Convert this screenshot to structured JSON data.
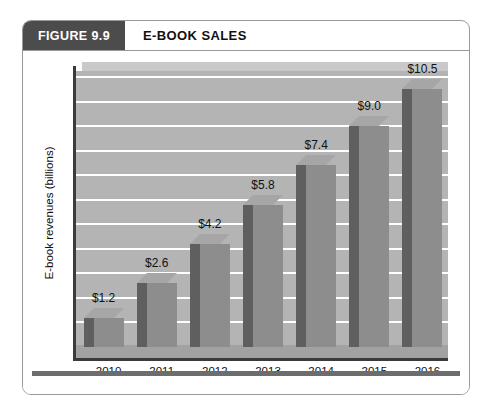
{
  "figure": {
    "number_label": "FIGURE 9.9",
    "title": "E-BOOK SALES"
  },
  "chart_data": {
    "type": "bar",
    "title": "E-BOOK SALES",
    "xlabel": "",
    "ylabel": "E-book revenues (billions)",
    "categories": [
      "2010",
      "2011",
      "2012",
      "2013",
      "2014",
      "2015",
      "2016"
    ],
    "values": [
      1.2,
      2.6,
      4.2,
      5.8,
      7.4,
      9.0,
      10.5
    ],
    "value_labels": [
      "$1.2",
      "$2.6",
      "$4.2",
      "$5.8",
      "$7.4",
      "$9.0",
      "$10.5"
    ],
    "ylim": [
      0,
      11
    ],
    "ytick_labels": [
      "$0",
      "$1",
      "$2",
      "$3",
      "$4",
      "$5",
      "$6",
      "$7",
      "$8",
      "$9",
      "$10",
      "$11"
    ],
    "ytick_values": [
      0,
      1,
      2,
      3,
      4,
      5,
      6,
      7,
      8,
      9,
      10,
      11
    ],
    "grid": true,
    "legend": false,
    "three_d": true,
    "colors": {
      "bar_front": "#8d8d8d",
      "bar_side": "#5f5f5f",
      "bar_top": "#a6a6a6",
      "plot_background": "#b4b4b4",
      "gridline": "#ffffff",
      "axis": "#3b3b3b",
      "header_box": "#4c4c4c",
      "bottom_rule": "#6d6d6d"
    }
  }
}
